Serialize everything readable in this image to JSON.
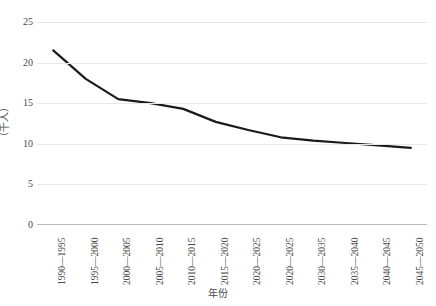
{
  "chart_data": {
    "type": "line",
    "title": "",
    "xlabel": "年份",
    "ylabel": "（千人）",
    "grid": true,
    "legend": "none",
    "xlim": [
      0,
      11
    ],
    "ylim": [
      0,
      25
    ],
    "ytick_values": [
      0,
      5,
      10,
      15,
      20,
      25
    ],
    "ytick_labels": [
      "0",
      "5",
      "10",
      "15",
      "20",
      "25"
    ],
    "categories": [
      "1990—1995",
      "1995—2000",
      "2000—2005",
      "2005—2010",
      "2010—2015",
      "2015—2020",
      "2020—2025",
      "2020—2025",
      "2030—2035",
      "2035—2040",
      "2040—2045",
      "2045—2050"
    ],
    "series": [
      {
        "name": "人口",
        "values": [
          21.5,
          18.0,
          15.5,
          15.0,
          14.3,
          12.7,
          11.7,
          10.8,
          10.4,
          10.1,
          9.8,
          9.5
        ],
        "color": "#1a1a1a",
        "line_width": 2.2,
        "markers": false
      }
    ]
  },
  "style": {
    "grid_color": "#e8e8e8",
    "axis_color": "#b9b9b9",
    "text_color": "#4a4a4a",
    "background": "#ffffff"
  }
}
